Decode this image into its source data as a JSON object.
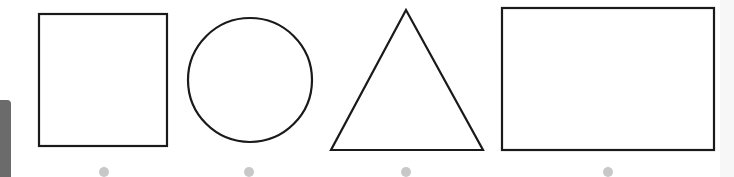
{
  "figure": {
    "stroke_color": "#1a1a1a",
    "dot_color": "#c8c8c8",
    "background": "#ffffff",
    "shapes": [
      {
        "name": "square",
        "x": 39,
        "y": 14,
        "width": 128,
        "height": 132,
        "dot": {
          "cx": 104,
          "cy": 172
        }
      },
      {
        "name": "circle",
        "cx": 250,
        "cy": 80,
        "r": 62,
        "dot": {
          "cx": 249,
          "cy": 172
        }
      },
      {
        "name": "triangle",
        "points": "406,10 331,150 483,150",
        "dot": {
          "cx": 406,
          "cy": 172
        }
      },
      {
        "name": "rectangle",
        "x": 502,
        "y": 8,
        "width": 212,
        "height": 142,
        "dot": {
          "cx": 608,
          "cy": 172
        }
      }
    ]
  }
}
